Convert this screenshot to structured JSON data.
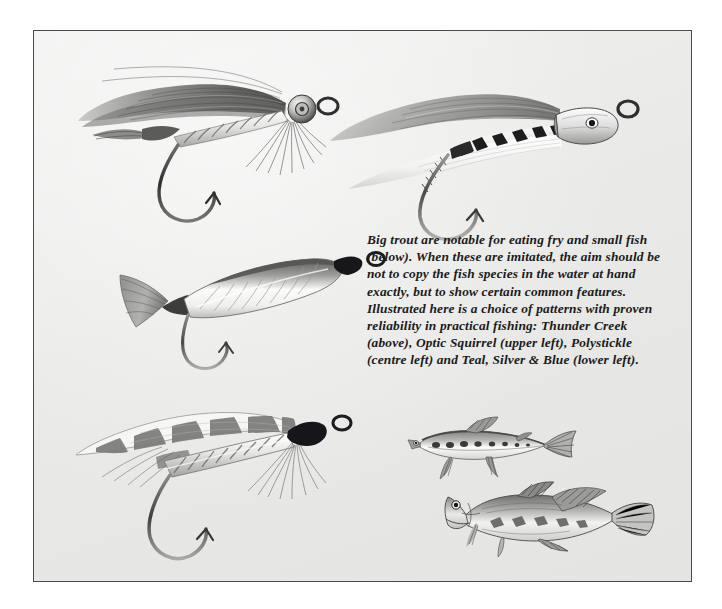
{
  "page": {
    "background_color": "#ffffff",
    "plate_background_color": "#ececeb",
    "border_color": "#4a4a4a",
    "ink_color": "#1b1b1b"
  },
  "caption": {
    "text": "Big trout are notable for eating fry and small fish (below). When these are imitated, the aim should be not to copy the fish species in the water at hand exactly, but to show certain common features. Illustrated here is a choice of patterns with proven reliability in practical fishing: Thunder Creek (above), Optic Squirrel (upper left), Polystickle  (centre left)  and Teal, Silver & Blue  (lower left)."
  },
  "figures": [
    {
      "id": "optic-squirrel",
      "name": "Optic Squirrel",
      "position_label": "upper left",
      "kind": "fishing-fly-illustration"
    },
    {
      "id": "thunder-creek",
      "name": "Thunder Creek",
      "position_label": "above",
      "kind": "fishing-fly-illustration"
    },
    {
      "id": "polystickle",
      "name": "Polystickle",
      "position_label": "centre left",
      "kind": "fishing-fly-illustration"
    },
    {
      "id": "teal-silver-blue",
      "name": "Teal, Silver & Blue",
      "position_label": "lower left",
      "kind": "fishing-fly-illustration"
    },
    {
      "id": "minnow",
      "name": "Minnow fry",
      "position_label": "below right upper",
      "kind": "fish-illustration"
    },
    {
      "id": "bullhead",
      "name": "Bullhead",
      "position_label": "below right lower",
      "kind": "fish-illustration"
    }
  ]
}
